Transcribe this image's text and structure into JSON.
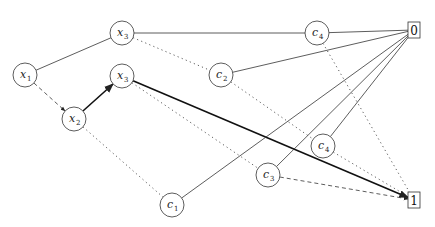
{
  "diagram": {
    "type": "binary decision diagram",
    "nodes": [
      {
        "id": "x1",
        "var": "x",
        "sub": "1",
        "cx": 25,
        "cy": 75
      },
      {
        "id": "x3a",
        "var": "x",
        "sub": "3",
        "cx": 122,
        "cy": 33
      },
      {
        "id": "x3b",
        "var": "x",
        "sub": "3",
        "cx": 122,
        "cy": 76
      },
      {
        "id": "x2",
        "var": "x",
        "sub": "2",
        "cx": 74,
        "cy": 119
      },
      {
        "id": "c4a",
        "var": "c",
        "sub": "4",
        "cx": 317,
        "cy": 33
      },
      {
        "id": "c2",
        "var": "c",
        "sub": "2",
        "cx": 221,
        "cy": 75
      },
      {
        "id": "c4b",
        "var": "c",
        "sub": "4",
        "cx": 323,
        "cy": 146
      },
      {
        "id": "c3",
        "var": "c",
        "sub": "3",
        "cx": 268,
        "cy": 175
      },
      {
        "id": "c1",
        "var": "c",
        "sub": "1",
        "cx": 172,
        "cy": 205
      }
    ],
    "terminals": [
      {
        "id": "t0",
        "label": "0",
        "x": 408,
        "y": 22,
        "w": 12,
        "h": 16
      },
      {
        "id": "t1",
        "label": "1",
        "x": 408,
        "y": 192,
        "w": 12,
        "h": 16
      }
    ],
    "edges": [
      {
        "from": "x1",
        "to": "x3a",
        "style": "solid",
        "arrow": false
      },
      {
        "from": "x1",
        "to": "x2",
        "style": "dashed",
        "arrow": true
      },
      {
        "from": "x2",
        "to": "x3b",
        "style": "bold",
        "arrow": true
      },
      {
        "from": "x2",
        "to": "c1",
        "style": "dotted",
        "arrow": false
      },
      {
        "from": "x3a",
        "to": "c4a",
        "style": "solid",
        "arrow": false
      },
      {
        "from": "x3a",
        "to": "c2",
        "style": "dotted",
        "arrow": false
      },
      {
        "from": "x3b",
        "to": "t1",
        "style": "bold",
        "arrow": true
      },
      {
        "from": "x3b",
        "to": "c3",
        "style": "dotted",
        "arrow": false
      },
      {
        "from": "c4a",
        "to": "t0",
        "style": "solid",
        "arrow": false
      },
      {
        "from": "c4a",
        "to": "t1",
        "style": "dotted",
        "arrow": false
      },
      {
        "from": "c2",
        "to": "t0",
        "style": "solid",
        "arrow": false
      },
      {
        "from": "c2",
        "to": "c4b",
        "style": "dotted",
        "arrow": false
      },
      {
        "from": "c1",
        "to": "t0",
        "style": "solid",
        "arrow": false
      },
      {
        "from": "c3",
        "to": "t0",
        "style": "solid",
        "arrow": false
      },
      {
        "from": "c4b",
        "to": "t0",
        "style": "solid",
        "arrow": false
      },
      {
        "from": "c3",
        "to": "t1",
        "style": "dashed",
        "arrow": true
      },
      {
        "from": "c4b",
        "to": "t1",
        "style": "dotted",
        "arrow": false
      }
    ],
    "node_radius": 12,
    "colors": {
      "stroke": "#333333",
      "bold": "#111111",
      "background": "#ffffff"
    }
  }
}
